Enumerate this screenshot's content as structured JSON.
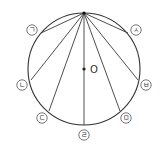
{
  "diagram": {
    "type": "circle-chords",
    "circle": {
      "cx": 84,
      "cy": 69,
      "r": 56
    },
    "apex": {
      "x": 84,
      "y": 13
    },
    "center": {
      "x": 84,
      "y": 69,
      "label": "O"
    },
    "points": [
      {
        "id": "giyeok",
        "label": "ㄱ",
        "x": 41,
        "y": 33,
        "lx": 32,
        "ly": 30
      },
      {
        "id": "nieun",
        "label": "ㄴ",
        "x": 31,
        "y": 80,
        "lx": 22,
        "ly": 85
      },
      {
        "id": "digeut",
        "label": "ㄷ",
        "x": 49,
        "y": 111,
        "lx": 42,
        "ly": 118
      },
      {
        "id": "rieul",
        "label": "ㄹ",
        "x": 84,
        "y": 125,
        "lx": 84,
        "ly": 135
      },
      {
        "id": "mieum",
        "label": "ㅁ",
        "x": 120,
        "y": 111,
        "lx": 126,
        "ly": 118
      },
      {
        "id": "bieup",
        "label": "ㅂ",
        "x": 138,
        "y": 80,
        "lx": 146,
        "ly": 85
      },
      {
        "id": "siot",
        "label": "ㅅ",
        "x": 128,
        "y": 33,
        "lx": 136,
        "ly": 30
      }
    ],
    "colors": {
      "stroke": "#333333",
      "background": "#ffffff"
    }
  }
}
